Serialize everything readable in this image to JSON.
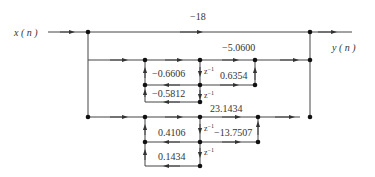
{
  "diagram": {
    "input_label": "x ( n )",
    "output_label": "y ( n )",
    "direct_gain": "−18",
    "section1": {
      "forward_gain": "−5.0600",
      "feedback_1": "−0.6606",
      "feedback_2": "−0.5812",
      "feedforward_1": "0.6354",
      "delay_1": "z",
      "delay_2": "z"
    },
    "section2": {
      "feedforward_0": "23.1434",
      "feedback_1": "0.4106",
      "feedback_2": "0.1434",
      "feedforward_1": "−13.7507",
      "delay_1": "z",
      "delay_2": "z"
    },
    "delay_exponent": "−1",
    "colors": {
      "line": "#333333",
      "node": "#111111",
      "background": "#ffffff"
    }
  }
}
